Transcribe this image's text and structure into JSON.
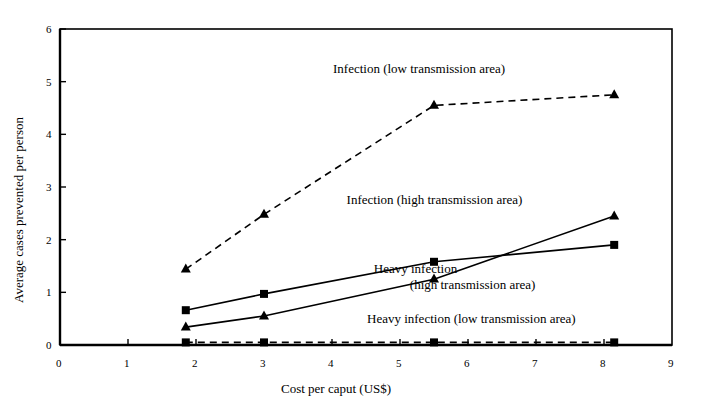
{
  "chart_data": {
    "type": "line",
    "title": "",
    "xlabel": "Cost per caput (US$)",
    "ylabel": "Average cases prevented per person",
    "xlim": [
      0,
      9
    ],
    "ylim": [
      0,
      6
    ],
    "xticks": [
      "0",
      "1",
      "2",
      "3",
      "4",
      "5",
      "6",
      "7",
      "8",
      "9"
    ],
    "yticks": [
      "0",
      "1",
      "2",
      "3",
      "4",
      "5",
      "6"
    ],
    "grid": false,
    "legend_position": "inline-annotations",
    "series": [
      {
        "name": "Infection   (low transmission area)",
        "marker": "triangle",
        "linestyle": "dashed",
        "x": [
          1.85,
          3.0,
          5.5,
          8.15
        ],
        "y": [
          1.44,
          2.48,
          4.55,
          4.75
        ]
      },
      {
        "name": "Infection   (high transmission area)",
        "marker": "triangle",
        "linestyle": "solid",
        "x": [
          1.85,
          3.0,
          5.5,
          8.15
        ],
        "y": [
          0.34,
          0.55,
          1.25,
          2.45
        ]
      },
      {
        "name": "Heavy infection   (high transmission area)",
        "marker": "square",
        "linestyle": "solid",
        "x": [
          1.85,
          3.0,
          5.5,
          8.15
        ],
        "y": [
          0.66,
          0.97,
          1.58,
          1.9
        ]
      },
      {
        "name": "Heavy infection   (low transmission area)",
        "marker": "square",
        "linestyle": "dashed",
        "x": [
          1.85,
          3.0,
          5.5,
          8.15
        ],
        "y": [
          0.05,
          0.05,
          0.05,
          0.05
        ]
      }
    ],
    "annotations": [
      {
        "text": "Infection   (low transmission area)",
        "x": 6.0,
        "y": 5.25
      },
      {
        "text": "Infection   (high transmission area)",
        "x": 6.2,
        "y": 2.75
      },
      {
        "text": "Heavy infection",
        "text2": "(high transmission area)",
        "x": 6.6,
        "y": 1.45
      },
      {
        "text": "Heavy infection   (low transmission area)",
        "x": 6.5,
        "y": 0.5
      }
    ],
    "colors": {
      "line": "#000000",
      "axis": "#000000",
      "background": "#ffffff"
    }
  }
}
